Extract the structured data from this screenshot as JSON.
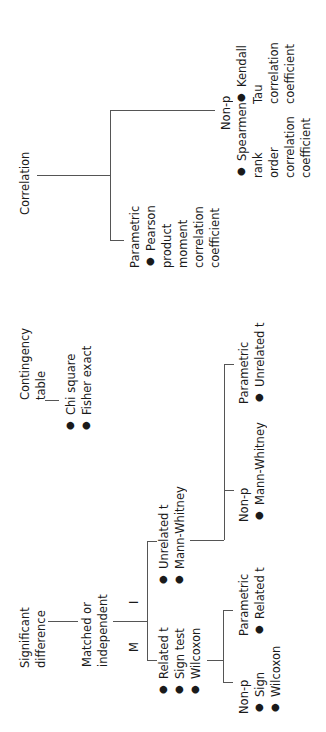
{
  "diagram": {
    "orientation": "rotated-90-ccw",
    "correlation": {
      "label": "Correlation",
      "parametric": {
        "label": "Parametric",
        "items": [
          [
            "Pearson",
            "product",
            "moment",
            "correlation",
            "coefficient"
          ]
        ]
      },
      "non_parametric": {
        "label": "Non-p",
        "items": [
          [
            "Spearmen",
            "rank",
            "order",
            "correlation",
            "coefficient"
          ],
          [
            "Kendall",
            "Tau",
            "correlation",
            "coefficient"
          ]
        ]
      }
    },
    "contingency": {
      "label_lines": [
        "Contingency",
        "table"
      ],
      "items": [
        "Chi square",
        "Fisher exact"
      ]
    },
    "significant_difference": {
      "label_lines": [
        "Significant",
        "difference"
      ],
      "matched_or_independent": {
        "label_lines": [
          "Matched or",
          "independent"
        ],
        "independent_marker": "I",
        "matched_marker": "M",
        "independent": {
          "items": [
            "Unrelated t",
            "Mann-Whitney"
          ],
          "non_parametric": {
            "label": "Non-p",
            "items": [
              "Mann-Whitney"
            ]
          },
          "parametric": {
            "label": "Parametric",
            "items": [
              "Unrelated t"
            ]
          }
        },
        "matched": {
          "items": [
            "Related t",
            "Sign test",
            "Wilcoxon"
          ],
          "non_parametric": {
            "label": "Non-p",
            "items": [
              "Sign",
              "Wilcoxon"
            ]
          },
          "parametric": {
            "label": "Parametric",
            "items": [
              "Related t"
            ]
          }
        }
      }
    }
  }
}
